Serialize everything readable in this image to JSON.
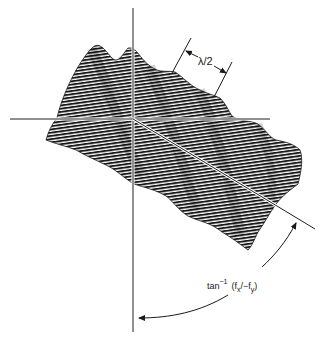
{
  "figure": {
    "type": "3D sinusoidal grating surface with axes",
    "labels": {
      "wavelength": "λ/2",
      "angle_prefix": "tan",
      "angle_exp": "−1",
      "angle_arg_open": "(f",
      "angle_sub_x": "x",
      "angle_mid": "/−f",
      "angle_sub_y": "y",
      "angle_close": ")"
    },
    "colors": {
      "ink": "#1a1a1a",
      "background": "#ffffff",
      "axis": "#222222"
    }
  }
}
